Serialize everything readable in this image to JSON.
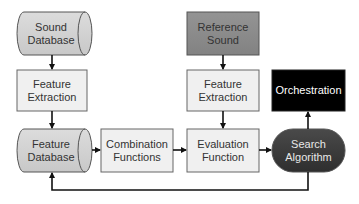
{
  "diagram": {
    "type": "flowchart",
    "colors": {
      "light_box": "#f0f0f0",
      "cylinder_fill": "#d3d3d3",
      "reference_fill": "#8c8c8c",
      "orchestration_fill": "#000000",
      "search_fill": "#3c3c3c",
      "stroke": "#555555",
      "arrow": "#111111"
    },
    "nodes": {
      "sound_database": {
        "label": "Sound\nDatabase",
        "shape": "cylinder"
      },
      "feature_extraction_left": {
        "label": "Feature\nExtraction",
        "shape": "rectangle"
      },
      "feature_database": {
        "label": "Feature\nDatabase",
        "shape": "cylinder"
      },
      "combination_functions": {
        "label": "Combination\nFunctions",
        "shape": "rectangle"
      },
      "reference_sound": {
        "label": "Reference\nSound",
        "shape": "rectangle"
      },
      "feature_extraction_right": {
        "label": "Feature\nExtraction",
        "shape": "rectangle"
      },
      "evaluation_function": {
        "label": "Evaluation\nFunction",
        "shape": "rectangle"
      },
      "orchestration": {
        "label": "Orchestration",
        "shape": "rectangle"
      },
      "search_algorithm": {
        "label": "Search\nAlgorithm",
        "shape": "rounded-pill"
      }
    },
    "edges": [
      {
        "from": "Sound Database",
        "to": "Feature Extraction (left)"
      },
      {
        "from": "Feature Extraction (left)",
        "to": "Feature Database"
      },
      {
        "from": "Feature Database",
        "to": "Combination Functions"
      },
      {
        "from": "Combination Functions",
        "to": "Evaluation Function"
      },
      {
        "from": "Reference Sound",
        "to": "Feature Extraction (right)"
      },
      {
        "from": "Feature Extraction (right)",
        "to": "Evaluation Function"
      },
      {
        "from": "Evaluation Function",
        "to": "Search Algorithm"
      },
      {
        "from": "Search Algorithm",
        "to": "Orchestration"
      },
      {
        "from": "Search Algorithm",
        "to": "Feature Database",
        "note": "feedback loop along bottom"
      }
    ]
  }
}
